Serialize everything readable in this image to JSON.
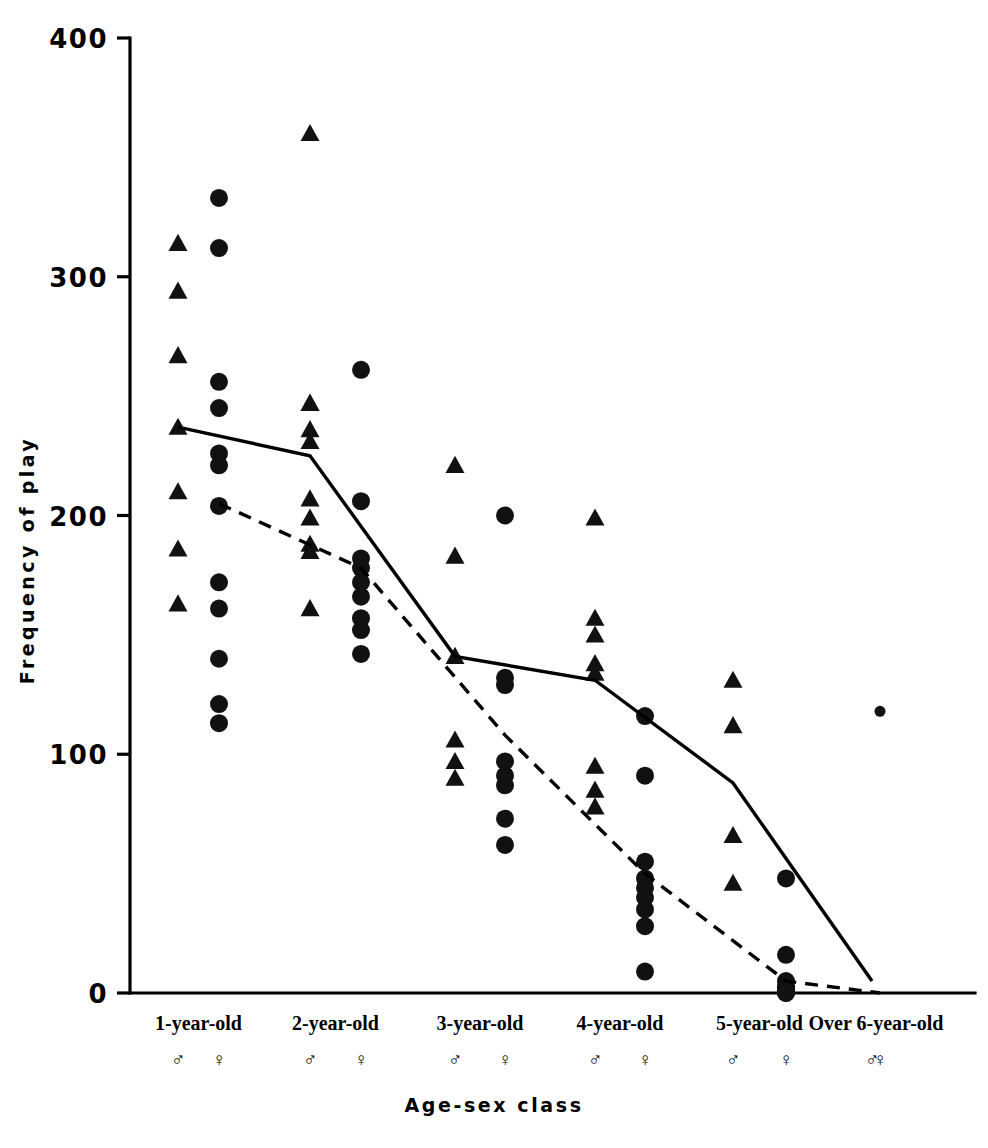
{
  "chart_data": {
    "type": "scatter",
    "title": "",
    "xlabel": "Age-sex class",
    "ylabel": "Frequency of play",
    "ylim": [
      0,
      400
    ],
    "yticks": [
      0,
      100,
      200,
      300,
      400
    ],
    "ytick_labels": [
      "0",
      "100",
      "200",
      "300",
      "400"
    ],
    "grid": false,
    "legend_position": "none",
    "categories": [
      "1-year-old",
      "2-year-old",
      "3-year-old",
      "4-year-old",
      "5-year-old",
      "Over 6-year-old"
    ],
    "sex_symbols": {
      "male": "♂",
      "female": "♀"
    },
    "series": [
      {
        "name": "male",
        "marker": "triangle",
        "values_by_category": {
          "1-year-old": [
            314,
            294,
            267,
            237,
            210,
            186,
            163
          ],
          "2-year-old": [
            360,
            247,
            247,
            236,
            231,
            207,
            199,
            188,
            185,
            161
          ],
          "3-year-old": [
            221,
            183,
            141,
            106,
            97,
            90
          ],
          "4-year-old": [
            199,
            157,
            150,
            138,
            134,
            95,
            85,
            78
          ],
          "5-year-old": [
            131,
            112,
            66,
            46
          ],
          "Over 6-year-old": []
        }
      },
      {
        "name": "female",
        "marker": "circle",
        "values_by_category": {
          "1-year-old": [
            333,
            312,
            256,
            245,
            226,
            221,
            204,
            172,
            161,
            140,
            121,
            113
          ],
          "2-year-old": [
            261,
            206,
            182,
            178,
            172,
            166,
            157,
            152,
            142
          ],
          "3-year-old": [
            200,
            132,
            129,
            97,
            91,
            87,
            73,
            62
          ],
          "4-year-old": [
            116,
            91,
            55,
            48,
            44,
            40,
            35,
            28,
            9
          ],
          "5-year-old": [
            48,
            16,
            5,
            3,
            2,
            2,
            1,
            1,
            0,
            0
          ],
          "Over 6-year-old": [
            118
          ]
        }
      }
    ],
    "mean_lines": [
      {
        "name": "male-mean",
        "style": "solid",
        "points": [
          {
            "category": "1-year-old",
            "value": 237
          },
          {
            "category": "2-year-old",
            "value": 225
          },
          {
            "category": "3-year-old",
            "value": 141
          },
          {
            "category": "4-year-old",
            "value": 131
          },
          {
            "category": "5-year-old",
            "value": 88
          },
          {
            "category": "Over 6-year-old",
            "value": 5
          }
        ]
      },
      {
        "name": "female-mean",
        "style": "dashed",
        "points": [
          {
            "category": "1-year-old",
            "value": 205
          },
          {
            "category": "2-year-old",
            "value": 178
          },
          {
            "category": "3-year-old",
            "value": 108
          },
          {
            "category": "4-year-old",
            "value": 50
          },
          {
            "category": "5-year-old",
            "value": 5
          },
          {
            "category": "Over 6-year-old",
            "value": 0
          }
        ]
      }
    ]
  },
  "colors": {
    "marker": "#111111",
    "axis": "#000000",
    "background": "#ffffff"
  }
}
